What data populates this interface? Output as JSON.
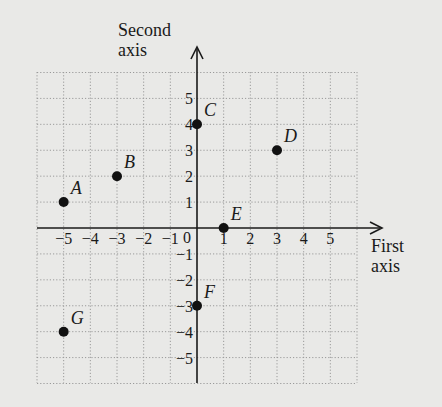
{
  "chart_data": {
    "type": "scatter",
    "title": "",
    "xlabel": "First axis",
    "ylabel": "Second axis",
    "xlabel_lines": [
      "First",
      "axis"
    ],
    "ylabel_lines": [
      "Second",
      "axis"
    ],
    "xlim": [
      -6,
      6
    ],
    "ylim": [
      -6,
      6
    ],
    "grid": true,
    "x_ticks": [
      -5,
      -4,
      -3,
      -2,
      -1,
      1,
      2,
      3,
      4,
      5
    ],
    "y_ticks": [
      5,
      4,
      3,
      2,
      1,
      -1,
      -2,
      -3,
      -4,
      -5
    ],
    "origin_label": "0",
    "points": [
      {
        "label": "A",
        "x": -5,
        "y": 1
      },
      {
        "label": "B",
        "x": -3,
        "y": 2
      },
      {
        "label": "C",
        "x": 0,
        "y": 4
      },
      {
        "label": "D",
        "x": 3,
        "y": 3
      },
      {
        "label": "E",
        "x": 1,
        "y": 0
      },
      {
        "label": "F",
        "x": 0,
        "y": -3
      },
      {
        "label": "G",
        "x": -5,
        "y": -4
      }
    ]
  },
  "colors": {
    "background": "#e9e9e7",
    "grid": "#9a9a9a",
    "axis": "#1a1a1a",
    "point": "#111111"
  }
}
